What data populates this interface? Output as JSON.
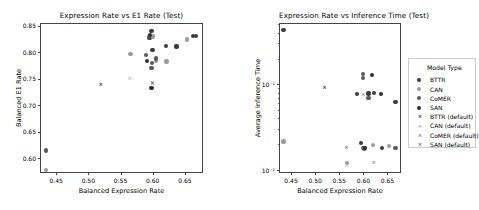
{
  "figure": {
    "width": 478,
    "height": 210,
    "background": "#ffffff"
  },
  "legend": {
    "title": "Model Type",
    "entries": [
      {
        "label": "BTTR",
        "marker": "circle",
        "color": "#3b3b3b"
      },
      {
        "label": "CAN",
        "marker": "circle",
        "color": "#9a9a9a"
      },
      {
        "label": "CoMER",
        "marker": "circle",
        "color": "#5a5a5a"
      },
      {
        "label": "SAN",
        "marker": "circle",
        "color": "#2e2e2e"
      },
      {
        "label": "BTTR (default)",
        "marker": "cross",
        "color": "#2e2e2e"
      },
      {
        "label": "CAN (default)",
        "marker": "cross",
        "color": "#b5b5b5"
      },
      {
        "label": "CoMER (default)",
        "marker": "cross",
        "color": "#8a8a8a"
      },
      {
        "label": "SAN (default)",
        "marker": "cross",
        "color": "#6f6f6f"
      }
    ]
  },
  "chart_data": [
    {
      "type": "scatter",
      "title": "Expression Rate vs E1 Rate (Test)",
      "xlabel": "Balanced Expression Rate",
      "ylabel": "Balanced E1 Rate",
      "xlim": [
        0.425,
        0.678
      ],
      "ylim": [
        0.572,
        0.855
      ],
      "xticks": [
        0.45,
        0.5,
        0.55,
        0.6,
        0.65
      ],
      "xticklabels": [
        "0.45",
        "0.50",
        "0.55",
        "0.60",
        "0.65"
      ],
      "yticks": [
        0.6,
        0.65,
        0.7,
        0.75,
        0.8,
        0.85
      ],
      "yticklabels": [
        "0.60",
        "0.65",
        "0.70",
        "0.75",
        "0.80",
        "0.85"
      ],
      "grid": false,
      "yscale": "linear",
      "legend_position": "none",
      "series": [
        {
          "name": "BTTR",
          "marker": "circle",
          "color": "#3b3b3b",
          "points": [
            {
              "x": 0.595,
              "y": 0.827
            },
            {
              "x": 0.598,
              "y": 0.8405
            },
            {
              "x": 0.5995,
              "y": 0.804
            },
            {
              "x": 0.62,
              "y": 0.811
            },
            {
              "x": 0.637,
              "y": 0.8105
            },
            {
              "x": 0.662,
              "y": 0.831
            },
            {
              "x": 0.667,
              "y": 0.8305
            }
          ]
        },
        {
          "name": "CAN",
          "marker": "circle",
          "color": "#9a9a9a",
          "points": [
            {
              "x": 0.5655,
              "y": 0.7965
            },
            {
              "x": 0.601,
              "y": 0.8295
            },
            {
              "x": 0.6045,
              "y": 0.7835
            },
            {
              "x": 0.6215,
              "y": 0.7825
            },
            {
              "x": 0.653,
              "y": 0.824
            },
            {
              "x": 0.4345,
              "y": 0.5775
            }
          ]
        },
        {
          "name": "CoMER",
          "marker": "circle",
          "color": "#5a5a5a",
          "points": [
            {
              "x": 0.589,
              "y": 0.7945
            },
            {
              "x": 0.5945,
              "y": 0.8285
            },
            {
              "x": 0.599,
              "y": 0.779
            },
            {
              "x": 0.6045,
              "y": 0.788
            },
            {
              "x": 0.598,
              "y": 0.7695
            },
            {
              "x": 0.4345,
              "y": 0.6145
            }
          ]
        },
        {
          "name": "SAN",
          "marker": "circle",
          "color": "#2e2e2e",
          "points": [
            {
              "x": 0.596,
              "y": 0.833
            },
            {
              "x": 0.5915,
              "y": 0.783
            },
            {
              "x": 0.598,
              "y": 0.733
            }
          ]
        },
        {
          "name": "BTTR (default)",
          "marker": "cross",
          "color": "#2e2e2e",
          "points": [
            {
              "x": 0.5195,
              "y": 0.7375
            }
          ]
        },
        {
          "name": "CAN (default)",
          "marker": "cross",
          "color": "#b5b5b5",
          "points": [
            {
              "x": 0.5645,
              "y": 0.75
            }
          ]
        },
        {
          "name": "CoMER (default)",
          "marker": "cross",
          "color": "#8a8a8a",
          "points": [
            {
              "x": 0.599,
              "y": 0.7415
            }
          ]
        },
        {
          "name": "SAN (default)",
          "marker": "cross",
          "color": "#6f6f6f",
          "points": [
            {
              "x": 0.5995,
              "y": 0.74
            }
          ]
        }
      ]
    },
    {
      "type": "scatter",
      "title": "Expression Rate vs Inference Time (Test)",
      "xlabel": "Balanced Expression Rate",
      "ylabel": "Average Inference Time",
      "xlim": [
        0.425,
        0.678
      ],
      "ylim": [
        0.0092,
        0.52
      ],
      "xticks": [
        0.45,
        0.5,
        0.55,
        0.6,
        0.65
      ],
      "xticklabels": [
        "0.45",
        "0.50",
        "0.55",
        "0.60",
        "0.65"
      ],
      "yticks": [
        0.1,
        0.01
      ],
      "yticklabels": [
        "10⁻¹",
        "10⁻²"
      ],
      "grid": false,
      "yscale": "log",
      "legend_position": "right",
      "series": [
        {
          "name": "BTTR",
          "marker": "circle",
          "color": "#3b3b3b",
          "points": [
            {
              "x": 0.4345,
              "y": 0.43
            },
            {
              "x": 0.587,
              "y": 0.077
            },
            {
              "x": 0.6105,
              "y": 0.078
            },
            {
              "x": 0.6215,
              "y": 0.079
            },
            {
              "x": 0.6665,
              "y": 0.0615
            },
            {
              "x": 0.5955,
              "y": 0.0205
            },
            {
              "x": 0.6385,
              "y": 0.0182
            }
          ]
        },
        {
          "name": "CAN",
          "marker": "circle",
          "color": "#9a9a9a",
          "points": [
            {
              "x": 0.4345,
              "y": 0.0215
            },
            {
              "x": 0.6205,
              "y": 0.0195
            },
            {
              "x": 0.653,
              "y": 0.0192
            },
            {
              "x": 0.604,
              "y": 0.0178
            },
            {
              "x": 0.5655,
              "y": 0.012
            }
          ]
        },
        {
          "name": "CoMER",
          "marker": "circle",
          "color": "#5a5a5a",
          "points": [
            {
              "x": 0.599,
              "y": 0.119
            },
            {
              "x": 0.5985,
              "y": 0.131
            },
            {
              "x": 0.6105,
              "y": 0.069
            },
            {
              "x": 0.5995,
              "y": 0.018
            },
            {
              "x": 0.601,
              "y": 0.0178
            },
            {
              "x": 0.6665,
              "y": 0.018
            }
          ]
        },
        {
          "name": "SAN",
          "marker": "circle",
          "color": "#2e2e2e",
          "points": [
            {
              "x": 0.6185,
              "y": 0.129
            },
            {
              "x": 0.637,
              "y": 0.0775
            },
            {
              "x": 0.603,
              "y": 0.018
            }
          ]
        },
        {
          "name": "BTTR (default)",
          "marker": "cross",
          "color": "#2e2e2e",
          "points": [
            {
              "x": 0.5195,
              "y": 0.09
            }
          ]
        },
        {
          "name": "CAN (default)",
          "marker": "cross",
          "color": "#b5b5b5",
          "points": [
            {
              "x": 0.5655,
              "y": 0.0112
            }
          ]
        },
        {
          "name": "CoMER (default)",
          "marker": "cross",
          "color": "#8a8a8a",
          "points": [
            {
              "x": 0.6,
              "y": 0.0755
            },
            {
              "x": 0.6215,
              "y": 0.0119
            }
          ]
        },
        {
          "name": "SAN (default)",
          "marker": "cross",
          "color": "#6f6f6f",
          "points": [
            {
              "x": 0.565,
              "y": 0.0182
            }
          ]
        }
      ]
    }
  ]
}
